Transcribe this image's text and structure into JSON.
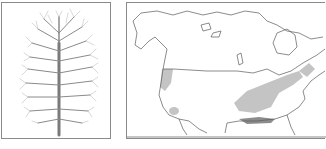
{
  "figure": {
    "tree_panel": {
      "label": "Tree silhouette illustration"
    },
    "map_panel": {
      "label": "North America range map",
      "colors": {
        "outline": "#5a5a5a",
        "native_range": "#c4c4c4",
        "dense_range": "#8c8c8c",
        "border": "#8a8a8a"
      }
    },
    "caption": ""
  }
}
